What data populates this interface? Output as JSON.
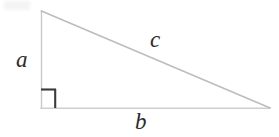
{
  "figure": {
    "type": "right-triangle-diagram",
    "background_color": "#ffffff",
    "stroke_color": "#c9c9c9",
    "right_angle_color": "#3a3a3a",
    "label_color": "#2b2b2b",
    "vertices": {
      "apex": {
        "x": 41,
        "y": 11
      },
      "bottom_left": {
        "x": 41,
        "y": 108
      },
      "bottom_right": {
        "x": 270,
        "y": 108
      }
    },
    "right_angle_marker": {
      "x": 41,
      "y": 89,
      "size": 15,
      "at_vertex": "bottom_left"
    },
    "labels": {
      "leg_vertical": "a",
      "leg_horizontal": "b",
      "hypotenuse": "c"
    }
  }
}
